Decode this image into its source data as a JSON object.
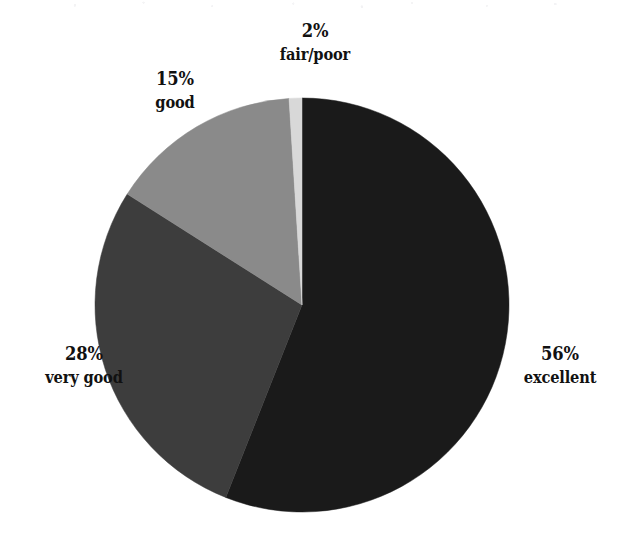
{
  "chart_data": {
    "type": "pie",
    "title": "",
    "subtitle": "",
    "xlabel": "",
    "ylabel": "",
    "legend_position": "none",
    "grid": false,
    "labels_show_percent": true,
    "categories": [
      "excellent",
      "very good",
      "good",
      "fair/poor"
    ],
    "values": [
      56,
      28,
      15,
      2
    ],
    "value_unit": "%",
    "slices": [
      {
        "category": "excellent",
        "value": 56,
        "percent_label": "56%",
        "color": "#1a1a1a",
        "start_angle_deg": 0,
        "end_angle_deg": 201.6,
        "label_position": "right"
      },
      {
        "category": "very good",
        "value": 28,
        "percent_label": "28%",
        "color": "#3d3d3d",
        "start_angle_deg": 201.6,
        "end_angle_deg": 302.4,
        "label_position": "left"
      },
      {
        "category": "good",
        "value": 15,
        "percent_label": "15%",
        "color": "#8a8a8a",
        "start_angle_deg": 302.4,
        "end_angle_deg": 356.4,
        "label_position": "upper-left"
      },
      {
        "category": "fair/poor",
        "value": 2,
        "percent_label": "2%",
        "color": "#d8d8d8",
        "start_angle_deg": 356.4,
        "end_angle_deg": 360,
        "label_position": "top"
      }
    ],
    "geometry": {
      "center_x": 302,
      "center_y": 305,
      "radius": 207,
      "start_at_twelve_oclock": true,
      "direction": "clockwise"
    }
  },
  "labels": {
    "fair_poor": {
      "percent": "2%",
      "category": "fair/poor"
    },
    "good": {
      "percent": "15%",
      "category": "good"
    },
    "very_good": {
      "percent": "28%",
      "category": "very good"
    },
    "excellent": {
      "percent": "56%",
      "category": "excellent"
    }
  }
}
